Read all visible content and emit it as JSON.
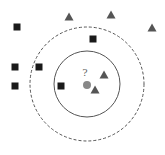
{
  "diagram": {
    "query_label": "?",
    "colors": {
      "square": "#1a1a1a",
      "triangle": "#555555",
      "query": "#888888",
      "circle": "#555555",
      "background": "#ffffff"
    },
    "inner_circle": {
      "cx": 87,
      "cy": 84,
      "r": 33,
      "style": "solid"
    },
    "outer_circle": {
      "cx": 87,
      "cy": 84,
      "r": 57,
      "style": "dashed"
    },
    "query_point": {
      "cx": 87,
      "cy": 85,
      "r": 4
    },
    "squares": [
      {
        "x": 17,
        "y": 27
      },
      {
        "x": 93,
        "y": 39
      },
      {
        "x": 15,
        "y": 67
      },
      {
        "x": 39,
        "y": 67
      },
      {
        "x": 15,
        "y": 86
      },
      {
        "x": 61,
        "y": 86
      }
    ],
    "triangles": [
      {
        "x": 69,
        "y": 17
      },
      {
        "x": 111,
        "y": 15
      },
      {
        "x": 152,
        "y": 28
      },
      {
        "x": 104,
        "y": 75
      },
      {
        "x": 95,
        "y": 90
      }
    ]
  }
}
